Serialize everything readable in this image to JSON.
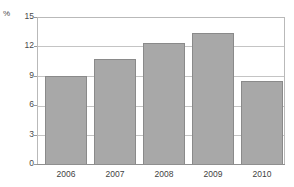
{
  "chart_data": {
    "type": "bar",
    "title": "",
    "subtitle": "",
    "xlabel": "",
    "ylabel": "%",
    "unit_label": "%",
    "categories": [
      "2006",
      "2007",
      "2008",
      "2009",
      "2010"
    ],
    "values": [
      9.0,
      10.7,
      12.4,
      13.4,
      8.5
    ],
    "series": [
      {
        "name": "",
        "values": [
          9.0,
          10.7,
          12.4,
          13.4,
          8.5
        ]
      }
    ],
    "ylim": [
      0,
      15
    ],
    "yticks": [
      0,
      3,
      6,
      9,
      12,
      15
    ],
    "ytick_labels": [
      "0",
      "3",
      "6",
      "9",
      "12",
      "15"
    ],
    "xtick_labels": [
      "2006",
      "2007",
      "2008",
      "2009",
      "2010"
    ],
    "grid": "horizontal",
    "legend": "none",
    "colors": {
      "bar_fill": "#a8a8a8",
      "bar_border": "#8a8a8a",
      "gridline": "#c4c4c4",
      "frame": "#b9b9b9",
      "axis": "#8f8f8f",
      "tick_text": "#4a4a4a",
      "background": "#ffffff"
    }
  }
}
